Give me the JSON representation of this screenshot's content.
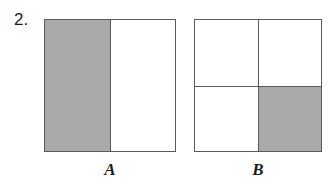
{
  "problem": {
    "number": "2."
  },
  "colors": {
    "shaded": "#aaaaaa",
    "blank": "#ffffff",
    "stroke": "#5a5a5a",
    "text": "#1c1c1c",
    "background": "#ffffff"
  },
  "figures": [
    {
      "id": "A",
      "caption": "A",
      "shape": "square",
      "partition": "halves-vertical",
      "parts_total": 2,
      "parts_shaded": 1,
      "fraction_shaded": "1/2",
      "cells": [
        {
          "id": "a-left",
          "position": "left-half",
          "state": "shaded"
        },
        {
          "id": "a-right",
          "position": "right-half",
          "state": "blank"
        }
      ]
    },
    {
      "id": "B",
      "caption": "B",
      "shape": "square",
      "partition": "quarters-grid",
      "parts_total": 4,
      "parts_shaded": 1,
      "fraction_shaded": "1/4",
      "cells": [
        {
          "id": "b-tl",
          "position": "top-left",
          "state": "blank"
        },
        {
          "id": "b-tr",
          "position": "top-right",
          "state": "blank"
        },
        {
          "id": "b-bl",
          "position": "bottom-left",
          "state": "blank"
        },
        {
          "id": "b-br",
          "position": "bottom-right",
          "state": "shaded"
        }
      ]
    }
  ]
}
